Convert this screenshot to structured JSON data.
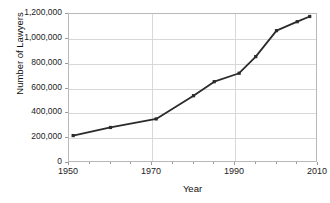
{
  "chart_data": {
    "type": "line",
    "title": "",
    "xlabel": "Year",
    "ylabel": "Number of Lawyers",
    "xlim": [
      1950,
      2010
    ],
    "ylim": [
      0,
      1200000
    ],
    "grid": true,
    "legend": null,
    "xticks": [
      {
        "value": 1950,
        "label": "1950"
      },
      {
        "value": 1970,
        "label": "1970"
      },
      {
        "value": 1990,
        "label": "1990"
      },
      {
        "value": 2010,
        "label": "2010"
      }
    ],
    "yticks": [
      {
        "value": 0,
        "label": "0"
      },
      {
        "value": 200000,
        "label": "200,000"
      },
      {
        "value": 400000,
        "label": "400,000"
      },
      {
        "value": 600000,
        "label": "600,000"
      },
      {
        "value": 800000,
        "label": "800,000"
      },
      {
        "value": 1000000,
        "label": "1,000,000"
      },
      {
        "value": 1200000,
        "label": "1,200,000"
      }
    ],
    "series": [
      {
        "name": "Number of Lawyers",
        "color": "#2b2b2b",
        "marker": "square",
        "x": [
          1951,
          1960,
          1971,
          1980,
          1985,
          1991,
          1995,
          2000,
          2005,
          2008
        ],
        "values": [
          221000,
          286000,
          355000,
          542000,
          655000,
          723000,
          857000,
          1066000,
          1138000,
          1180000
        ]
      }
    ]
  }
}
